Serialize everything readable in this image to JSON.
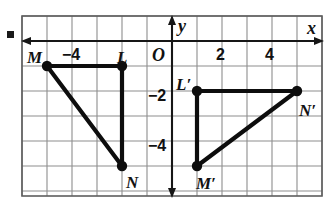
{
  "figure": {
    "kind": "coordinate-plane-transformation",
    "bullet": "square-bullet",
    "axis_labels": {
      "x": "x",
      "y": "y",
      "origin": "O"
    },
    "x_ticks": [
      {
        "value": -4,
        "label": "−4"
      },
      {
        "value": 2,
        "label": "2"
      },
      {
        "value": 4,
        "label": "4"
      }
    ],
    "y_ticks": [
      {
        "value": -2,
        "label": "−2"
      },
      {
        "value": -4,
        "label": "−4"
      }
    ],
    "grid": {
      "x_min": -6,
      "x_max": 6,
      "y_min": -6,
      "y_max": 1,
      "spacing": 1,
      "show": true
    },
    "shapes": [
      {
        "name": "triangle-MLN",
        "vertices": [
          {
            "label": "M",
            "x": -5,
            "y": -1
          },
          {
            "label": "L",
            "x": -2,
            "y": -1
          },
          {
            "label": "N",
            "x": -2,
            "y": -5
          }
        ]
      },
      {
        "name": "triangle-L-prime-M-prime-N-prime",
        "vertices": [
          {
            "label": "L′",
            "x": 1,
            "y": -2
          },
          {
            "label": "N′",
            "x": 5,
            "y": -2
          },
          {
            "label": "M′",
            "x": 1,
            "y": -5
          }
        ]
      }
    ],
    "point_labels": {
      "M": "M",
      "L": "L",
      "N": "N",
      "L_prime": "L′",
      "M_prime": "M′",
      "N_prime": "N′"
    },
    "colors": {
      "stroke": "#0d0d0d",
      "grid": "#8d8d8d",
      "frame": "#5d5d5d",
      "axis": "#161616",
      "background": "#ffffff"
    }
  },
  "chart_data": {
    "type": "scatter",
    "title": "",
    "xlabel": "x",
    "ylabel": "y",
    "xlim": [
      -6,
      6
    ],
    "ylim": [
      -6,
      1
    ],
    "grid": true,
    "legend": "none",
    "x_tick_labels": [
      "−4",
      "2",
      "4"
    ],
    "y_tick_labels": [
      "−2",
      "−4"
    ],
    "series": [
      {
        "name": "Triangle MLN (pre-image)",
        "closed": true,
        "points": [
          {
            "label": "M",
            "x": -5,
            "y": -1
          },
          {
            "label": "L",
            "x": -2,
            "y": -1
          },
          {
            "label": "N",
            "x": -2,
            "y": -5
          }
        ]
      },
      {
        "name": "Triangle L'M'N' (image)",
        "closed": true,
        "points": [
          {
            "label": "L′",
            "x": 1,
            "y": -2
          },
          {
            "label": "N′",
            "x": 5,
            "y": -2
          },
          {
            "label": "M′",
            "x": 1,
            "y": -5
          }
        ]
      }
    ]
  }
}
